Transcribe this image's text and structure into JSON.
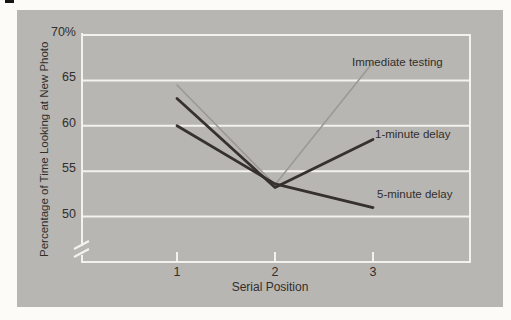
{
  "figure": {
    "panel_background": "#b8b6b3",
    "page_background": "#fcfbf8",
    "text_color": "#312e2b"
  },
  "chart_data": {
    "type": "line",
    "title": "",
    "xlabel": "Serial Position",
    "ylabel": "Percentage of Time Looking at New Photo",
    "x": [
      1,
      2,
      3
    ],
    "x_tick_labels": [
      "1",
      "2",
      "3"
    ],
    "y_tick_values": [
      70,
      65,
      60,
      55,
      50
    ],
    "y_tick_labels": [
      "70%",
      "65",
      "60",
      "55",
      "50"
    ],
    "ylim": [
      45,
      70
    ],
    "axis_break": true,
    "grid": true,
    "legend_position": "inline-annotations",
    "style": {
      "grid_color": "#f3f2ee",
      "dark_line_color": "#36312e",
      "light_line_color": "#9b9996"
    },
    "series": [
      {
        "name": "Immediate testing",
        "values": [
          64.5,
          53.5,
          67
        ],
        "color": "#9b9996",
        "stroke_width": 1.6
      },
      {
        "name": "1-minute delay",
        "values": [
          63,
          53.2,
          58.5
        ],
        "color": "#36312e",
        "stroke_width": 2.8
      },
      {
        "name": "5-minute delay",
        "values": [
          60,
          53.6,
          51
        ],
        "color": "#36312e",
        "stroke_width": 2.8
      }
    ],
    "annotations": [
      {
        "text": "Immediate testing",
        "x": 352,
        "y": 55
      },
      {
        "text": "1-minute delay",
        "x": 375,
        "y": 127
      },
      {
        "text": "5-minute delay",
        "x": 377,
        "y": 187
      }
    ]
  }
}
